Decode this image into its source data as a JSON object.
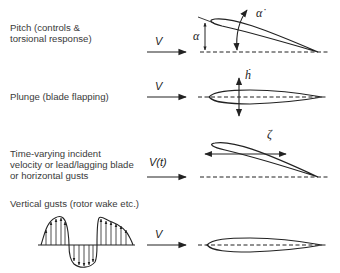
{
  "rows": [
    {
      "id": "pitch",
      "label_lines": [
        "Pitch (controls &",
        "torsional response)"
      ],
      "velocity_label": "V",
      "motion_symbols": [
        "α",
        "α̇"
      ]
    },
    {
      "id": "plunge",
      "label_lines": [
        "Plunge (blade flapping)"
      ],
      "velocity_label": "V",
      "motion_symbols": [
        "ḣ"
      ]
    },
    {
      "id": "lead-lag",
      "label_lines": [
        "Time-varying incident",
        "velocity or lead/lagging blade",
        "or horizontal gusts"
      ],
      "velocity_label": "V(t)",
      "motion_symbols": [
        "ζ"
      ]
    },
    {
      "id": "vertical-gusts",
      "label_lines": [
        "Vertical gusts (rotor wake etc.)"
      ],
      "velocity_label": "V",
      "motion_symbols": []
    }
  ],
  "colors": {
    "ink": "#222222",
    "text": "#3a3a3a",
    "background": "#ffffff"
  }
}
